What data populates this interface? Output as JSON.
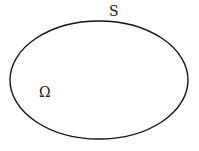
{
  "figure": {
    "kind": "geometry-diagram",
    "background_color": "#ffffff",
    "stroke_color": "#141414",
    "text_color": "#1a1a1a",
    "width": 199,
    "height": 151
  },
  "shape": {
    "name": "closed-boundary-ellipse",
    "type": "ellipse",
    "center_x": 99,
    "center_y": 80,
    "radius_x": 89,
    "radius_y": 59,
    "stroke_width": 1.4,
    "fill": "none"
  },
  "labels": {
    "surface": {
      "text": "S",
      "meaning": "boundary-surface",
      "x": 113,
      "y": 11
    },
    "domain": {
      "text": "Ω",
      "meaning": "domain-omega",
      "x": 44,
      "y": 92
    }
  },
  "chart_data": {
    "type": "diagram",
    "title": "",
    "annotations": [
      {
        "label": "S",
        "role": "boundary curve label",
        "x": 113,
        "y": 11
      },
      {
        "label": "Ω",
        "role": "interior region label",
        "x": 44,
        "y": 92
      }
    ],
    "elements": [
      {
        "type": "ellipse",
        "cx": 99,
        "cy": 80,
        "rx": 89,
        "ry": 59,
        "stroke": "#141414",
        "fill": "none"
      }
    ]
  }
}
